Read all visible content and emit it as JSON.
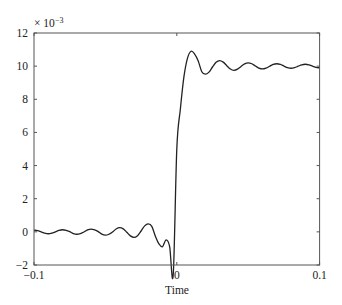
{
  "chart_data": {
    "type": "line",
    "title": "",
    "xlabel": "Time",
    "ylabel": "",
    "y_multiplier_label": "× 10",
    "y_multiplier_exponent": "−3",
    "xlim": [
      -0.1,
      0.1
    ],
    "ylim": [
      -2,
      12
    ],
    "grid": false,
    "legend": null,
    "x_ticks": [
      -0.1,
      0,
      0.1
    ],
    "x_tick_labels": [
      "−0.1",
      "0",
      "0.1"
    ],
    "y_ticks": [
      -2,
      0,
      2,
      4,
      6,
      8,
      10,
      12
    ],
    "y_tick_labels": [
      "−2",
      "0",
      "2",
      "4",
      "6",
      "8",
      "10",
      "12"
    ],
    "series": [
      {
        "name": "step response",
        "color": "#222222",
        "x": [
          -0.1,
          -0.0975,
          -0.095,
          -0.0925,
          -0.09,
          -0.0875,
          -0.085,
          -0.0825,
          -0.08,
          -0.0775,
          -0.075,
          -0.0725,
          -0.07,
          -0.0675,
          -0.065,
          -0.0625,
          -0.06,
          -0.0575,
          -0.055,
          -0.0525,
          -0.05,
          -0.0475,
          -0.045,
          -0.0425,
          -0.04,
          -0.0375,
          -0.035,
          -0.0325,
          -0.03,
          -0.0275,
          -0.025,
          -0.0225,
          -0.02,
          -0.0175,
          -0.015,
          -0.0125,
          -0.01,
          -0.0075,
          -0.005,
          -0.0025,
          0,
          0.0025,
          0.005,
          0.0075,
          0.01,
          0.0125,
          0.015,
          0.0175,
          0.02,
          0.0225,
          0.025,
          0.0275,
          0.03,
          0.0325,
          0.035,
          0.0375,
          0.04,
          0.0425,
          0.045,
          0.0475,
          0.05,
          0.0525,
          0.055,
          0.0575,
          0.06,
          0.0625,
          0.065,
          0.0675,
          0.07,
          0.0725,
          0.075,
          0.0775,
          0.08,
          0.0825,
          0.085,
          0.0875,
          0.09,
          0.0925,
          0.095,
          0.0975,
          0.1
        ],
        "y": [
          0.101,
          0.071,
          -0.004,
          -0.08,
          -0.113,
          -0.079,
          0.004,
          0.088,
          0.127,
          0.09,
          0.008,
          -0.101,
          -0.145,
          -0.101,
          -0.011,
          0.118,
          0.169,
          0.12,
          0.016,
          -0.141,
          -0.203,
          -0.145,
          -0.011,
          0.175,
          0.253,
          0.181,
          -0.026,
          -0.242,
          -0.338,
          -0.23,
          0.052,
          0.363,
          0.486,
          0.335,
          -0.265,
          -0.73,
          -0.895,
          -0.485,
          -0.895,
          -2.584,
          5.0,
          7.416,
          9.363,
          10.485,
          10.895,
          10.73,
          10.317,
          9.665,
          9.514,
          9.637,
          9.948,
          10.23,
          10.338,
          10.242,
          10.026,
          9.825,
          9.747,
          9.819,
          9.984,
          10.141,
          10.203,
          10.145,
          10.011,
          9.882,
          9.831,
          9.88,
          9.992,
          10.101,
          10.145,
          10.103,
          10.006,
          9.912,
          9.873,
          9.91,
          9.996,
          10.079,
          10.113,
          10.08,
          10.004,
          9.929,
          9.899
        ]
      }
    ]
  }
}
